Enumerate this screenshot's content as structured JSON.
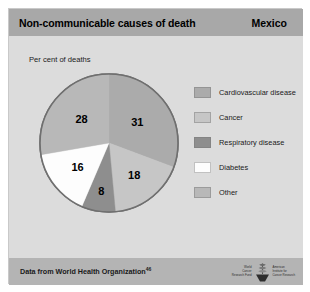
{
  "header": {
    "title": "Non-communicable causes of death",
    "country": "Mexico"
  },
  "chart_data": {
    "type": "pie",
    "title": "Non-communicable causes of death",
    "subtitle": "Mexico",
    "ylabel": "Per cent of deaths",
    "xlabel": "",
    "unit": "per cent",
    "legend_position": "right",
    "categories": [
      "Cardiovascular disease",
      "Cancer",
      "Respiratory disease",
      "Diabetes",
      "Other"
    ],
    "values": [
      31,
      18,
      8,
      16,
      28
    ],
    "labels": [
      "31",
      "18",
      "8",
      "16",
      "28"
    ],
    "colors": [
      "#ababab",
      "#c6c6c6",
      "#8e8e8e",
      "#fdfdfd",
      "#b8b8b8"
    ],
    "start_angle_deg": 0,
    "direction": "clockwise"
  },
  "axis": {
    "label": "Per cent of deaths"
  },
  "legend": {
    "items": [
      {
        "label": "Cardiovascular disease",
        "color": "#ababab",
        "value": 31
      },
      {
        "label": "Cancer",
        "color": "#c6c6c6",
        "value": 18
      },
      {
        "label": "Respiratory disease",
        "color": "#8e8e8e",
        "value": 8
      },
      {
        "label": "Diabetes",
        "color": "#fdfdfd",
        "value": 16
      },
      {
        "label": "Other",
        "color": "#b8b8b8",
        "value": 28
      }
    ]
  },
  "footer": {
    "source_text": "Data from World Health Organization",
    "source_ref": "46",
    "logo_left_lines": [
      "World",
      "Cancer",
      "Research Fund"
    ],
    "logo_right_lines": [
      "American",
      "Institute for",
      "Cancer Research"
    ]
  },
  "colors": {
    "card_background": "#d4d4d4",
    "header_background": "#a8a8a8",
    "body_background": "#dcdcdc",
    "footer_background": "#b4b4b4",
    "pie_outline": "#6f6f6f",
    "text": "#000000"
  }
}
